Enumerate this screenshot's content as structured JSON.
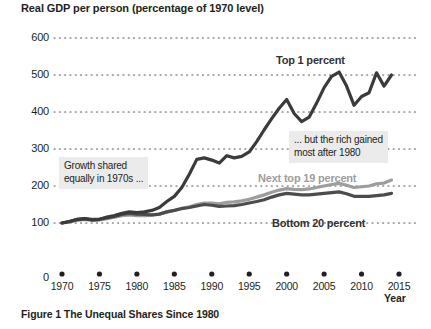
{
  "figure": {
    "caption": "Figure 1  The Unequal Shares Since 1980"
  },
  "chart_data": {
    "type": "line",
    "title": "Real GDP per person (percentage of 1970 level)",
    "xlabel": "Year",
    "ylabel": "",
    "xlim": [
      1970,
      2015
    ],
    "ylim": [
      0,
      600
    ],
    "grid": true,
    "grid_style": "dotted-horizontal",
    "legend_position": "inline-annotations",
    "yticks": [
      "0",
      "100",
      "200",
      "300",
      "400",
      "500",
      "600"
    ],
    "ytick_values": [
      0,
      100,
      200,
      300,
      400,
      500,
      600
    ],
    "xticks": [
      "1970",
      "1975",
      "1980",
      "1985",
      "1990",
      "1995",
      "2000",
      "2005",
      "2010",
      "2015"
    ],
    "xtick_values": [
      1970,
      1975,
      1980,
      1985,
      1990,
      1995,
      2000,
      2005,
      2010,
      2015
    ],
    "colors": {
      "top_1_percent": "#3b3a3c",
      "next_top_19_percent": "#9d9d9d",
      "bottom_20_percent": "#4d4b4d"
    },
    "x": [
      1970,
      1971,
      1972,
      1973,
      1974,
      1975,
      1976,
      1977,
      1978,
      1979,
      1980,
      1981,
      1982,
      1983,
      1984,
      1985,
      1986,
      1987,
      1988,
      1989,
      1990,
      1991,
      1992,
      1993,
      1994,
      1995,
      1996,
      1997,
      1998,
      1999,
      2000,
      2001,
      2002,
      2003,
      2004,
      2005,
      2006,
      2007,
      2008,
      2009,
      2010,
      2011,
      2012,
      2013,
      2014
    ],
    "series": [
      {
        "name": "Top 1 percent",
        "label": "Top 1 percent",
        "color": "#3b3a3c",
        "values": [
          100,
          104,
          110,
          112,
          108,
          110,
          116,
          120,
          126,
          130,
          128,
          130,
          134,
          142,
          158,
          172,
          196,
          232,
          272,
          276,
          270,
          262,
          282,
          276,
          280,
          292,
          320,
          352,
          382,
          410,
          434,
          396,
          374,
          386,
          424,
          466,
          496,
          508,
          470,
          418,
          442,
          452,
          506,
          470,
          500
        ]
      },
      {
        "name": "Next top 19 percent",
        "label": "Next top 19 percent",
        "color": "#9d9d9d",
        "values": [
          100,
          103,
          107,
          110,
          108,
          108,
          112,
          116,
          120,
          122,
          120,
          120,
          121,
          124,
          130,
          134,
          140,
          144,
          150,
          154,
          154,
          152,
          156,
          157,
          160,
          164,
          170,
          176,
          183,
          189,
          193,
          191,
          190,
          192,
          196,
          200,
          204,
          207,
          202,
          196,
          198,
          200,
          206,
          208,
          216
        ]
      },
      {
        "name": "Bottom 20 percent",
        "label": "Bottom 20 percent",
        "color": "#4d4b4d",
        "values": [
          100,
          104,
          109,
          112,
          110,
          110,
          114,
          118,
          123,
          126,
          124,
          123,
          122,
          124,
          130,
          134,
          139,
          142,
          146,
          150,
          148,
          145,
          146,
          147,
          150,
          154,
          158,
          163,
          170,
          176,
          180,
          178,
          176,
          176,
          178,
          180,
          182,
          184,
          179,
          172,
          172,
          172,
          174,
          176,
          180
        ]
      }
    ],
    "annotations": [
      {
        "id": "callout-1970s",
        "text_line_1": "Growth shared",
        "text_line_2": "equally in 1970s ...",
        "anchor_x": 1974,
        "anchor_y": 250
      },
      {
        "id": "callout-after-1980",
        "text_line_1": "... but the rich gained",
        "text_line_2": "most after 1980",
        "anchor_x": 2002,
        "anchor_y": 310
      }
    ]
  }
}
